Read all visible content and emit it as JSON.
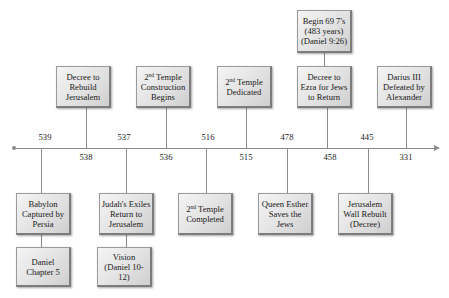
{
  "timeline": {
    "direction": "left-to-right (years BC descending)",
    "top_events": [
      {
        "id": "decree-rebuild",
        "text": "Decree to Rebuild Jerusalem",
        "year": "538"
      },
      {
        "id": "temple-construction",
        "text_sup": "nd",
        "text_pre": "2",
        "text_post": " Temple Construction Begins",
        "year": "536"
      },
      {
        "id": "temple-dedicated",
        "text_pre": "2",
        "text_sup": "nd",
        "text_post": " Temple Dedicated",
        "year": "515"
      },
      {
        "id": "decree-ezra",
        "text": "Decree to Ezra for Jews to Return",
        "year": "458"
      },
      {
        "id": "darius-defeated",
        "text": "Darius III Defeated by Alexander",
        "year": "331"
      }
    ],
    "top_top_event": {
      "id": "begin-69-sevens",
      "text": "Begin 69 7's (483 years) (Daniel 9:26)"
    },
    "bottom_events": [
      {
        "id": "babylon-captured",
        "text": "Babylon Captured by Persia",
        "year": "539"
      },
      {
        "id": "exiles-return",
        "text": "Judah's Exiles Return to Jerusalem",
        "year": "537"
      },
      {
        "id": "temple-completed",
        "text_pre": "2",
        "text_sup": "nd",
        "text_post": " Temple Completed",
        "year": "516"
      },
      {
        "id": "esther",
        "text": "Queen Esther Saves the Jews",
        "year": "478"
      },
      {
        "id": "wall-rebuilt",
        "text": "Jerusalem Wall Rebuilt (Decree)",
        "year": "445"
      }
    ],
    "bottom_bottom_events": [
      {
        "id": "daniel-5",
        "text": "Daniel Chapter 5"
      },
      {
        "id": "vision-daniel",
        "text": "Vision (Daniel 10-12)"
      }
    ],
    "labels_above_axis": [
      "539",
      "537",
      "516",
      "478",
      "445"
    ],
    "labels_below_axis": [
      "538",
      "536",
      "515",
      "458",
      "331"
    ]
  },
  "colors": {
    "box_fill": "#e2e2e2",
    "box_border": "#7c7c7c",
    "line": "#8c8c8c",
    "text": "#1a1a1a"
  }
}
